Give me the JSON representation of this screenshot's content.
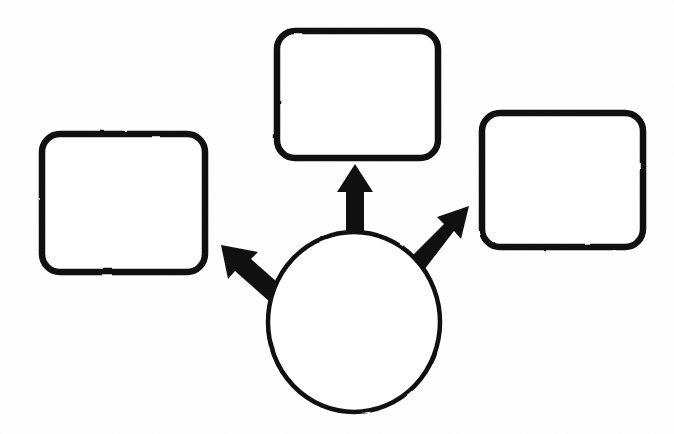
{
  "canvas": {
    "width": 674,
    "height": 434,
    "background_color": "#fefefe",
    "stroke_color": "#111111",
    "fill_color": "#ffffff",
    "description": "Hand-drawn style line diagram: one ellipse at bottom center with three thick solid arrows radiating outward to three empty rounded rectangles."
  },
  "diagram": {
    "type": "node-link-diagram",
    "title": "",
    "nodes": [
      {
        "id": "node-top",
        "name": "top-box",
        "shape": "rounded-rectangle",
        "label": "",
        "x": 277,
        "y": 31,
        "width": 161,
        "height": 127,
        "corner_radius": 18,
        "stroke_width": 6.5,
        "stroke_color": "#111111",
        "fill_color": "#ffffff"
      },
      {
        "id": "node-left",
        "name": "left-box",
        "shape": "rounded-rectangle",
        "label": "",
        "x": 42,
        "y": 134,
        "width": 163,
        "height": 138,
        "corner_radius": 18,
        "stroke_width": 6.5,
        "stroke_color": "#111111",
        "fill_color": "#ffffff"
      },
      {
        "id": "node-right",
        "name": "right-box",
        "shape": "rounded-rectangle",
        "label": "",
        "x": 482,
        "y": 113,
        "width": 161,
        "height": 134,
        "corner_radius": 18,
        "stroke_width": 6.5,
        "stroke_color": "#111111",
        "fill_color": "#ffffff"
      },
      {
        "id": "node-center",
        "name": "center-ellipse",
        "shape": "ellipse",
        "label": "",
        "cx": 354,
        "cy": 322,
        "rx": 86,
        "ry": 90,
        "stroke_width": 4.5,
        "stroke_color": "#111111",
        "fill_color": "#ffffff"
      }
    ],
    "edges": [
      {
        "id": "edge-center-to-top",
        "name": "arrow-up",
        "from": "node-center",
        "to": "node-top",
        "label": "",
        "direction": "up",
        "arrowhead": "solid-filled-triangle",
        "tip_x": 355,
        "tip_y": 164,
        "tail_x": 355,
        "tail_y": 238,
        "shaft_width": 18,
        "head_width": 36,
        "head_length": 28,
        "color": "#111111"
      },
      {
        "id": "edge-center-to-right",
        "name": "arrow-up-right",
        "from": "node-center",
        "to": "node-right",
        "label": "",
        "direction": "up-right",
        "arrowhead": "solid-filled-triangle",
        "tip_x": 469,
        "tip_y": 206,
        "tail_x": 418,
        "tail_y": 264,
        "shaft_width": 19,
        "head_width": 38,
        "head_length": 30,
        "color": "#111111"
      },
      {
        "id": "edge-center-to-left",
        "name": "arrow-up-left",
        "from": "node-center",
        "to": "node-left",
        "label": "",
        "direction": "up-left",
        "arrowhead": "solid-filled-triangle",
        "tip_x": 221,
        "tip_y": 245,
        "tail_x": 281,
        "tail_y": 294,
        "shaft_width": 19,
        "head_width": 38,
        "head_length": 30,
        "color": "#111111"
      }
    ]
  }
}
